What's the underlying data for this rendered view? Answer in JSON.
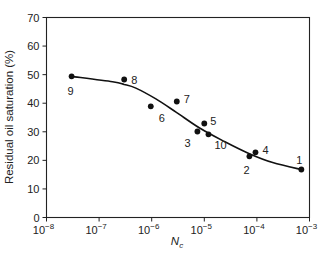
{
  "chart_data": {
    "type": "scatter",
    "title": "",
    "xlabel": "N_c",
    "xlabel_main": "N",
    "xlabel_sub": "c",
    "ylabel": "Residual oil saturation (%)",
    "xscale": "log",
    "xlim": [
      1e-08,
      0.001
    ],
    "ylim": [
      0,
      70
    ],
    "grid": false,
    "legend": null,
    "x_ticks": [
      {
        "exp": "−8",
        "value": 1e-08
      },
      {
        "exp": "−7",
        "value": 1e-07
      },
      {
        "exp": "−6",
        "value": 1e-06
      },
      {
        "exp": "−5",
        "value": 1e-05
      },
      {
        "exp": "−4",
        "value": 0.0001
      },
      {
        "exp": "−3",
        "value": 0.001
      }
    ],
    "x_tick_base": "10",
    "y_ticks": [
      0,
      10,
      20,
      30,
      40,
      50,
      60,
      70
    ],
    "points": [
      {
        "label": "1",
        "x": 0.0007,
        "y": 16.8
      },
      {
        "label": "2",
        "x": 7.2e-05,
        "y": 21.4
      },
      {
        "label": "3",
        "x": 7.4e-06,
        "y": 30.1
      },
      {
        "label": "4",
        "x": 9.4e-05,
        "y": 22.8
      },
      {
        "label": "5",
        "x": 1e-05,
        "y": 32.9
      },
      {
        "label": "6",
        "x": 9.6e-07,
        "y": 38.9
      },
      {
        "label": "7",
        "x": 3e-06,
        "y": 40.6
      },
      {
        "label": "8",
        "x": 3e-07,
        "y": 48.3
      },
      {
        "label": "9",
        "x": 3e-08,
        "y": 49.4
      },
      {
        "label": "10",
        "x": 1.2e-05,
        "y": 29.1
      }
    ],
    "trend_curve": {
      "description": "smooth fitted curve through data",
      "x": [
        3e-08,
        1.8e-07,
        3e-07,
        5e-07,
        1.2e-06,
        2.9e-06,
        8e-06,
        2.4e-05,
        7e-05,
        0.0002,
        0.0007
      ],
      "y": [
        49.4,
        47.5,
        46.6,
        45.3,
        41.5,
        36.9,
        31.4,
        26.6,
        22.4,
        19.2,
        16.8
      ]
    },
    "label_offsets": {
      "1": [
        -5,
        -10
      ],
      "2": [
        -6,
        14
      ],
      "3": [
        -13,
        11
      ],
      "4": [
        7,
        -2
      ],
      "5": [
        6,
        -3
      ],
      "6": [
        8,
        12
      ],
      "7": [
        7,
        -3
      ],
      "8": [
        7,
        0
      ],
      "9": [
        -4,
        15
      ],
      "10": [
        6,
        11
      ]
    }
  }
}
